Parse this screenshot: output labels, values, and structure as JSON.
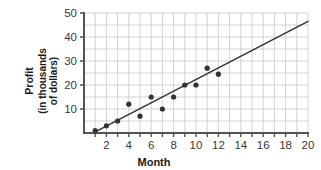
{
  "chart_data": {
    "type": "scatter",
    "title": "",
    "xlabel": "Month",
    "ylabel": "Profit (in thousands of dollars)",
    "ylabel_lines": [
      "Profit",
      "(in thousands",
      "of dollars)"
    ],
    "xlim": [
      0,
      20
    ],
    "ylim": [
      0,
      50
    ],
    "xticks": [
      2,
      4,
      6,
      8,
      10,
      12,
      14,
      16,
      18,
      20
    ],
    "yticks": [
      10,
      20,
      30,
      40,
      50
    ],
    "xtick_labels": [
      "2",
      "4",
      "6",
      "8",
      "10",
      "12",
      "14",
      "16",
      "18",
      "20"
    ],
    "ytick_labels": [
      "10",
      "20",
      "30",
      "40",
      "50"
    ],
    "grid": true,
    "grid_x_step": 1,
    "grid_y_step": 5,
    "legend": "none",
    "x": [
      1,
      2,
      3,
      4,
      5,
      6,
      7,
      8,
      9,
      10,
      11,
      12
    ],
    "y": [
      1,
      3,
      5,
      12,
      7,
      15,
      10,
      15,
      20,
      20,
      27,
      24.5
    ],
    "points": [
      {
        "x": 1,
        "y": 1
      },
      {
        "x": 2,
        "y": 3
      },
      {
        "x": 3,
        "y": 5
      },
      {
        "x": 4,
        "y": 12
      },
      {
        "x": 5,
        "y": 7
      },
      {
        "x": 6,
        "y": 15
      },
      {
        "x": 7,
        "y": 10
      },
      {
        "x": 8,
        "y": 15
      },
      {
        "x": 9,
        "y": 20
      },
      {
        "x": 10,
        "y": 20
      },
      {
        "x": 11,
        "y": 27
      },
      {
        "x": 12,
        "y": 24.5
      }
    ],
    "trendline": {
      "label": "line of best fit",
      "x0": 1,
      "y0": 0.5,
      "x1": 20,
      "y1": 46.5
    },
    "colors": {
      "point": "#333333",
      "trendline": "#333333",
      "axis": "#555555",
      "grid": "#c8c8c8",
      "background": "#ffffff",
      "text": "#1a1a1a"
    }
  }
}
